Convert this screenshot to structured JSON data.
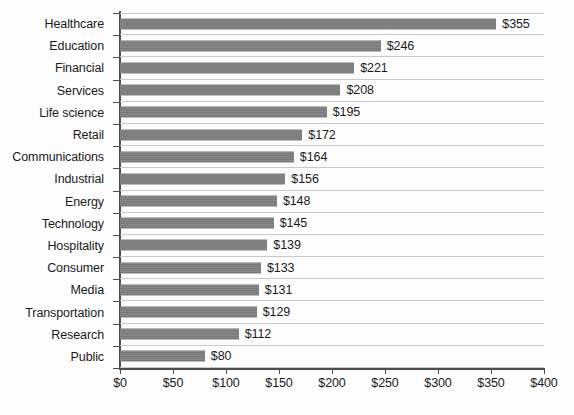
{
  "chart_data": {
    "type": "bar",
    "orientation": "horizontal",
    "title": "",
    "xlabel": "",
    "ylabel": "",
    "xlim": [
      0,
      400
    ],
    "grid": true,
    "legend": false,
    "value_prefix": "$",
    "categories": [
      "Healthcare",
      "Education",
      "Financial",
      "Services",
      "Life science",
      "Retail",
      "Communications",
      "Industrial",
      "Energy",
      "Technology",
      "Hospitality",
      "Consumer",
      "Media",
      "Transportation",
      "Research",
      "Public"
    ],
    "values": [
      355,
      246,
      221,
      208,
      195,
      172,
      164,
      156,
      148,
      145,
      139,
      133,
      131,
      129,
      112,
      80
    ],
    "data_labels": [
      "$355",
      "$246",
      "$221",
      "$208",
      "$195",
      "$172",
      "$164",
      "$156",
      "$148",
      "$145",
      "$139",
      "$133",
      "$131",
      "$129",
      "$112",
      "$80"
    ],
    "xticks": [
      0,
      50,
      100,
      150,
      200,
      250,
      300,
      350,
      400
    ],
    "xtick_labels": [
      "$0",
      "$50",
      "$100",
      "$150",
      "$200",
      "$250",
      "$300",
      "$350",
      "$400"
    ],
    "series": [
      {
        "name": "Amount",
        "color": "#7d7d7d",
        "values": [
          355,
          246,
          221,
          208,
          195,
          172,
          164,
          156,
          148,
          145,
          139,
          133,
          131,
          129,
          112,
          80
        ]
      }
    ],
    "colors": {
      "bar": "#7d7d7d",
      "gridline": "#c9c9c9",
      "axis": "#4d4d4d",
      "text": "#1a1a1a",
      "background": "#fdfdfd"
    }
  }
}
